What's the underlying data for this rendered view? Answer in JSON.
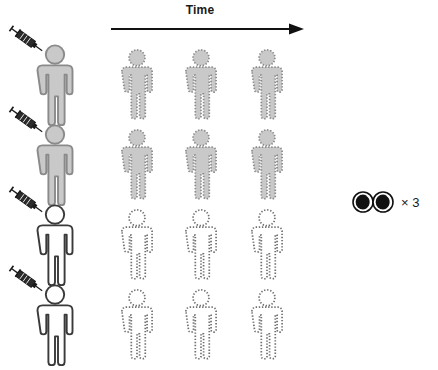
{
  "diagram": {
    "axis": {
      "label": "Time",
      "arrow_icon": "right-arrow-icon",
      "direction": "left-to-right"
    },
    "observation": {
      "icon": "eyes-icon",
      "repeat_label": "× 3",
      "repeat_count": 3
    },
    "colors": {
      "gray_fill": "#c9c9c9",
      "gray_outline": "#8a8a8a",
      "dark_outline": "#3a3a3a",
      "white_fill": "#ffffff",
      "arrow": "#111111",
      "text": "#111111",
      "syringe_body": "#ffffff",
      "syringe_outline": "#1a1a1a",
      "syringe_plunger": "#2b2b2b"
    },
    "rows": [
      {
        "id": "row-1",
        "syringe_icon": "syringe-icon",
        "baseline": {
          "fill": "gray",
          "outline": "solid",
          "icon": "person-icon"
        },
        "timepoints": [
          {
            "fill": "gray",
            "outline": "dotted",
            "icon": "person-icon"
          },
          {
            "fill": "gray",
            "outline": "dotted",
            "icon": "person-icon"
          },
          {
            "fill": "gray",
            "outline": "dotted",
            "icon": "person-icon"
          }
        ]
      },
      {
        "id": "row-2",
        "syringe_icon": "syringe-icon",
        "baseline": {
          "fill": "gray",
          "outline": "solid",
          "icon": "person-icon"
        },
        "timepoints": [
          {
            "fill": "gray",
            "outline": "dotted",
            "icon": "person-icon"
          },
          {
            "fill": "gray",
            "outline": "dotted",
            "icon": "person-icon"
          },
          {
            "fill": "gray",
            "outline": "dotted",
            "icon": "person-icon"
          }
        ]
      },
      {
        "id": "row-3",
        "syringe_icon": "syringe-icon",
        "baseline": {
          "fill": "white",
          "outline": "solid",
          "icon": "person-icon"
        },
        "timepoints": [
          {
            "fill": "white",
            "outline": "dotted",
            "icon": "person-icon"
          },
          {
            "fill": "white",
            "outline": "dotted",
            "icon": "person-icon"
          },
          {
            "fill": "white",
            "outline": "dotted",
            "icon": "person-icon"
          }
        ]
      },
      {
        "id": "row-4",
        "syringe_icon": "syringe-icon",
        "baseline": {
          "fill": "white",
          "outline": "solid",
          "icon": "person-icon"
        },
        "timepoints": [
          {
            "fill": "white",
            "outline": "dotted",
            "icon": "person-icon"
          },
          {
            "fill": "white",
            "outline": "dotted",
            "icon": "person-icon"
          },
          {
            "fill": "white",
            "outline": "dotted",
            "icon": "person-icon"
          }
        ]
      }
    ]
  }
}
